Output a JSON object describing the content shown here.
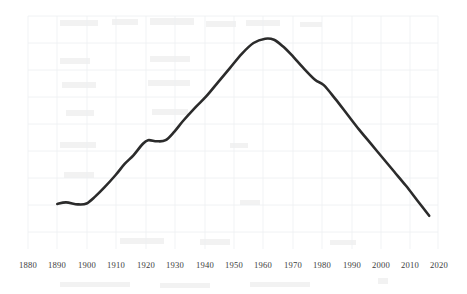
{
  "chart_data": {
    "type": "line",
    "title": "",
    "subtitle": "",
    "xlabel": "",
    "ylabel": "",
    "xlim": [
      1880,
      2020
    ],
    "ylim": [
      0,
      100
    ],
    "grid": true,
    "legend": null,
    "legend_position": "none",
    "line_color": "#2b2b2b",
    "grid_color": "#eceff1",
    "background_color": "#ffffff",
    "annotations": [],
    "x_tick_labels": [
      "1880",
      "1890",
      "1900",
      "1910",
      "1920",
      "1930",
      "1940",
      "1950",
      "1960",
      "1970",
      "1980",
      "1990",
      "2000",
      "2010",
      "2020"
    ],
    "x_ticks": [
      1880,
      1890,
      1900,
      1910,
      1920,
      1930,
      1940,
      1950,
      1960,
      1970,
      1980,
      1990,
      2000,
      2010,
      2020
    ],
    "y_tick_labels": [],
    "y_ticks": [],
    "series": [
      {
        "name": "series-1",
        "x": [
          1890,
          1893,
          1897,
          1900,
          1903,
          1906,
          1910,
          1913,
          1916,
          1919,
          1921,
          1924,
          1927,
          1930,
          1933,
          1937,
          1941,
          1945,
          1949,
          1953,
          1957,
          1961,
          1964,
          1967,
          1970,
          1974,
          1978,
          1981,
          1985,
          1989,
          1993,
          1997,
          2001,
          2005,
          2009,
          2013,
          2017
        ],
        "values": [
          13.0,
          13.7,
          12.8,
          13.2,
          16.5,
          20.5,
          26.5,
          31.5,
          35.5,
          40.5,
          42.5,
          42.0,
          42.5,
          46.5,
          51.5,
          57.5,
          63.0,
          69.5,
          76.0,
          82.5,
          87.5,
          89.5,
          89.0,
          86.0,
          82.0,
          76.0,
          70.5,
          68.0,
          61.5,
          54.5,
          47.5,
          41.0,
          34.5,
          28.0,
          21.5,
          14.5,
          7.5
        ]
      }
    ]
  },
  "figure": {
    "plot_left_px": 28,
    "plot_right_px": 438,
    "plot_top_px": 16,
    "plot_bottom_px": 232,
    "axis_label_row_y_px": 268
  }
}
